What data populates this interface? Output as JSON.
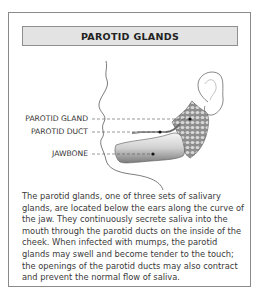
{
  "title": "PAROTID GLANDS",
  "labels": {
    "parotid_gland": "PAROTID GLAND",
    "parotid_duct": "PAROTID DUCT",
    "jawbone": "JAWBONE"
  },
  "caption": "The parotid glands, one of three sets of salivary glands, are located below the ears along the curve of the jaw. They continuously secrete saliva into the mouth through the parotid ducts on the inside of the cheek. When infected with mumps, the parotid glands may swell and become tender to the touch; the openings of the parotid ducts may also contract and prevent the normal flow of saliva.",
  "colors": {
    "header_bg": "#e3e3e3",
    "gland_fill": "#9a9a9a",
    "bone_fill": "#d4d4d4"
  }
}
